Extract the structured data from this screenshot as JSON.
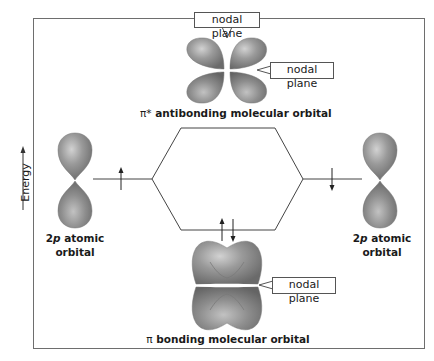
{
  "diagram": {
    "type": "molecular-orbital-energy-diagram",
    "axis": {
      "label": "Energy",
      "direction": "up"
    },
    "top_orbital": {
      "symbol": "π*",
      "caption": "antibonding molecular orbital",
      "callouts": [
        "nodal plane",
        "nodal plane"
      ]
    },
    "bottom_orbital": {
      "symbol": "π",
      "caption": "bonding molecular orbital",
      "callouts": [
        "nodal plane"
      ]
    },
    "left_atomic": {
      "line1_num": "2",
      "line1_sub": "p",
      "line1_rest": " atomic",
      "line2": "orbital",
      "electron": "up"
    },
    "right_atomic": {
      "line1_num": "2",
      "line1_sub": "p",
      "line1_rest": " atomic",
      "line2": "orbital",
      "electron": "down"
    },
    "bonding_electrons": [
      "up",
      "down"
    ],
    "colors": {
      "lobe": "#8f8f8f",
      "lobe_highlight": "#cfcfcf",
      "lobe_shadow": "#666666",
      "line": "#444444",
      "frame": "#6e6e6e"
    }
  }
}
